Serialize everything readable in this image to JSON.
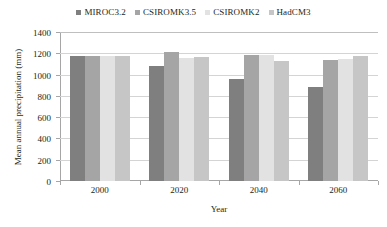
{
  "chart_data": {
    "type": "bar",
    "title": "",
    "xlabel": "Year",
    "ylabel": "Mean annual precipitation (mm)",
    "categories": [
      "2000",
      "2020",
      "2040",
      "2060"
    ],
    "ylim": [
      0,
      1400
    ],
    "yticks": [
      0,
      200,
      400,
      600,
      800,
      1000,
      1200,
      1400
    ],
    "ytick_labels": [
      "0",
      "200",
      "400",
      "600",
      "800",
      "1000",
      "1200",
      "1400"
    ],
    "grid": true,
    "legend_position": "top-center",
    "series": [
      {
        "name": "MIROC3.2",
        "color": "#7f7f7f",
        "values": [
          1175,
          1080,
          960,
          880
        ]
      },
      {
        "name": "CSIROMK3.5",
        "color": "#a5a5a5",
        "values": [
          1175,
          1215,
          1180,
          1140
        ]
      },
      {
        "name": "CSIROMK2",
        "color": "#e2e2e2",
        "values": [
          1175,
          1160,
          1180,
          1145
        ]
      },
      {
        "name": "HadCM3",
        "color": "#c6c6c6",
        "values": [
          1175,
          1165,
          1130,
          1175
        ]
      }
    ]
  },
  "legend": {
    "entries": [
      {
        "label": "MIROC3.2",
        "color": "#7f7f7f"
      },
      {
        "label": "CSIROMK3.5",
        "color": "#a5a5a5"
      },
      {
        "label": "CSIROMK2",
        "color": "#e2e2e2"
      },
      {
        "label": "HadCM3",
        "color": "#c6c6c6"
      }
    ]
  },
  "axes": {
    "y_title": "Mean annual precipitation (mm)",
    "x_title": "Year",
    "y_labels": [
      "1400",
      "1200",
      "1000",
      "800",
      "600",
      "400",
      "200",
      "0"
    ],
    "x_labels": [
      "2000",
      "2020",
      "2040",
      "2060"
    ]
  }
}
